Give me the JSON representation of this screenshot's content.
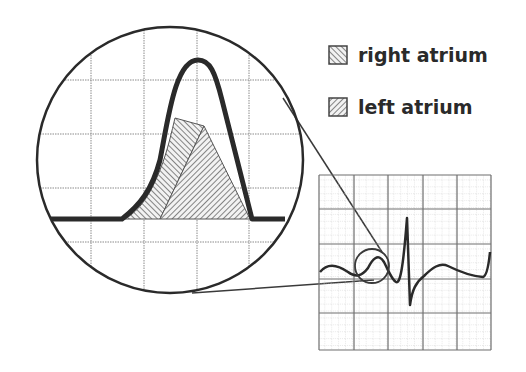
{
  "legend": {
    "items": [
      {
        "label": "right atrium",
        "hatch": "backslash"
      },
      {
        "label": "left atrium",
        "hatch": "slash"
      }
    ]
  },
  "colors": {
    "ink": "#2a2a2a",
    "grid": "#8a8a8a",
    "fine_grid": "#c8c8c8",
    "background": "#ffffff"
  },
  "magnifier": {
    "label": "magnified P wave"
  },
  "ecg": {
    "label": "ECG strip"
  }
}
